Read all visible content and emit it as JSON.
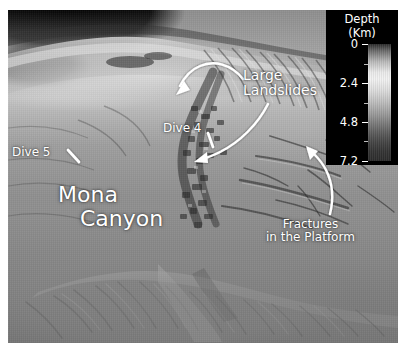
{
  "figure": {
    "kind": "shaded-relief bathymetry map",
    "background_color": "#ffffff",
    "annotation_color": "#ffffff"
  },
  "annotations": [
    {
      "id": "large-landslides",
      "line1": "Large",
      "line2": "Landslides",
      "marker": "curved-arrow-pointing-left"
    },
    {
      "id": "dive-4",
      "line1": "Dive 4",
      "line2": "",
      "marker": "short-tick-line"
    },
    {
      "id": "dive-5",
      "line1": "Dive 5",
      "line2": "",
      "marker": "short-tick-line"
    },
    {
      "id": "mona-canyon",
      "line1": "Mona",
      "line2": "Canyon",
      "marker": "none"
    },
    {
      "id": "fractures",
      "line1": "Fractures",
      "line2": "in the Platform",
      "marker": "curved-arrow-pointing-up"
    }
  ],
  "labels": {
    "large_landslides_l1": "Large",
    "large_landslides_l2": "Landslides",
    "dive4": "Dive 4",
    "dive5": "Dive 5",
    "mona_l1": "Mona",
    "mona_l2": "Canyon",
    "fractures_l1": "Fractures",
    "fractures_l2": "in the Platform"
  },
  "colorbar": {
    "title_line1": "Depth",
    "title_line2": "(Km)",
    "panel_color": "#000000",
    "text_color": "#ffffff",
    "orientation": "vertical",
    "ticks": [
      {
        "label": "0",
        "value": 0,
        "pos_pct": 0
      },
      {
        "label": "2.4",
        "value": 2.4,
        "pos_pct": 33.33
      },
      {
        "label": "4.8",
        "value": 4.8,
        "pos_pct": 66.66
      },
      {
        "label": "7.2",
        "value": 7.2,
        "pos_pct": 100
      }
    ],
    "minor_ticks_pct": [
      16.7,
      50,
      83.3
    ],
    "range_km": [
      0,
      7.2
    ],
    "gradient_stops": [
      "#2b2b2b",
      "#eaeaea",
      "#bdbdbd",
      "#7b7b7b",
      "#2c2c2c"
    ]
  }
}
